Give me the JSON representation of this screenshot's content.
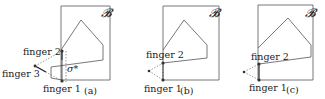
{
  "figure": {
    "panels": [
      {
        "id": "a",
        "caption": "(a)",
        "region_label": "𝓑",
        "finger_labels": [
          "finger 1",
          "finger 2",
          "finger 3"
        ],
        "sigma_label": "σ*"
      },
      {
        "id": "b",
        "caption": "(b)",
        "region_label": "𝓑",
        "finger_labels": [
          "finger 1",
          "finger 2"
        ]
      },
      {
        "id": "c",
        "caption": "(c)",
        "region_label": "𝓑",
        "finger_labels": [
          "finger 1",
          "finger 2"
        ]
      }
    ],
    "colors": {
      "stroke": "#555555",
      "dot": "#333333",
      "text": "#222222"
    }
  }
}
